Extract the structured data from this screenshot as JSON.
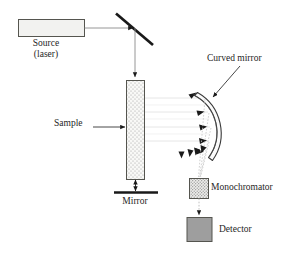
{
  "figure": {
    "type": "optical-instrument-schematic",
    "background_color": "#ffffff"
  },
  "labels": {
    "source_line1": "Source",
    "source_line2": "(laser)",
    "sample": "Sample",
    "mirror": "Mirror",
    "curved_mirror": "Curved mirror",
    "monochromator": "Monochromator",
    "detector": "Detector"
  },
  "components": [
    {
      "id": "source",
      "name": "source-laser-box",
      "shape": "rectangle",
      "x": 18,
      "y": 19,
      "width": 66,
      "height": 17,
      "fill": "#f2f2f0",
      "stroke": "#4d4d4d"
    },
    {
      "id": "flat-mirror-diagonal",
      "name": "diagonal-mirror",
      "shape": "line",
      "x1": 117,
      "y1": 15,
      "x2": 152,
      "y2": 45,
      "stroke": "#1a1a1a",
      "stroke_width": 2.6
    },
    {
      "id": "sample",
      "name": "sample-block",
      "shape": "rectangle",
      "x": 127,
      "y": 80,
      "width": 18,
      "height": 100,
      "fill": "#f7f7f5",
      "texture": "stipple-dots",
      "stroke": "#4d4d4d"
    },
    {
      "id": "bottom-mirror",
      "name": "flat-mirror-bottom",
      "shape": "line",
      "x1": 118,
      "y1": 192,
      "x2": 163,
      "y2": 192,
      "stroke": "#1a1a1a",
      "stroke_width": 2.2
    },
    {
      "id": "curved-mirror",
      "name": "curved-mirror-arc",
      "shape": "arc-crescent",
      "cx": 160,
      "cy": 127,
      "radius": 48,
      "stroke": "#333333"
    },
    {
      "id": "monochromator",
      "name": "monochromator-box",
      "shape": "rectangle",
      "x": 189,
      "y": 178,
      "width": 19,
      "height": 20,
      "fill": "#e2e2e0",
      "texture": "stipple-dots",
      "stroke": "#4d4d4d"
    },
    {
      "id": "detector",
      "name": "detector-box",
      "shape": "rectangle",
      "x": 189,
      "y": 217,
      "width": 25,
      "height": 24,
      "fill": "#9e9e9e",
      "stroke": "#4d4d4d"
    }
  ],
  "beams": {
    "incident_color": "#808080",
    "scattered_color": "#d9d9d9",
    "dotted_color": "#b3b3b3",
    "arrow_color": "#1a1a1a",
    "incident_path": "Source exits right, travels to diagonal mirror, reflects downward into top of sample",
    "transmitted_paths_count": 4,
    "converging_rays_count": 4
  },
  "leader_lines": [
    {
      "name": "sample-leader",
      "from": [
        93,
        127
      ],
      "to": [
        126,
        127
      ]
    },
    {
      "name": "curved-mirror-leader",
      "from": [
        238,
        67
      ],
      "to": [
        212,
        98
      ]
    }
  ],
  "colors": {
    "ink": "#262626",
    "box_stroke": "#4d4d4d",
    "black": "#1a1a1a",
    "detector_fill": "#9e9e9e",
    "source_fill": "#f2f2f0",
    "faint_beam": "#dcdcdc"
  }
}
